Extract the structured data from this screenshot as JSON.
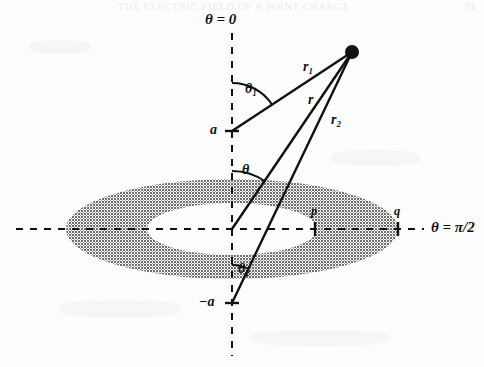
{
  "page": {
    "running_header": "THE ELECTRIC FIELD OF A POINT CHARGE",
    "page_number": "91",
    "background_color": "#fdfdfd",
    "ink_color": "#111111",
    "ring_fill_color": "#808080"
  },
  "figure": {
    "axes": {
      "vertical": {
        "label": "θ = 0",
        "style": "dashed",
        "x": 232,
        "y_top": 33,
        "y_bottom": 356
      },
      "horizontal": {
        "label": "θ = π/2",
        "style": "dashed",
        "y": 229,
        "x_left": 16,
        "x_right": 424
      }
    },
    "field_point": {
      "name": "field-point",
      "x": 352,
      "y": 52,
      "radius": 7
    },
    "origin": {
      "x": 232,
      "y": 229
    },
    "ticks": [
      {
        "id": "a",
        "label": "a",
        "axis": "vertical",
        "x": 232,
        "y": 131,
        "label_x": 210,
        "label_y": 123
      },
      {
        "id": "-a",
        "label": "−a",
        "axis": "vertical",
        "x": 232,
        "y": 303,
        "label_x": 199,
        "label_y": 295
      },
      {
        "id": "p",
        "label": "p",
        "axis": "horizontal",
        "x": 315,
        "y": 229,
        "label_x": 311,
        "label_y": 205
      },
      {
        "id": "q",
        "label": "q",
        "axis": "horizontal",
        "x": 398,
        "y": 229,
        "label_x": 394,
        "label_y": 205
      }
    ],
    "rays": [
      {
        "id": "r1",
        "label": "r₁",
        "from_x": 232,
        "from_y": 131,
        "to_x": 352,
        "to_y": 52,
        "label_x": 303,
        "label_y": 60
      },
      {
        "id": "r",
        "label": "r",
        "from_x": 232,
        "from_y": 229,
        "to_x": 352,
        "to_y": 52,
        "label_x": 308,
        "label_y": 93
      },
      {
        "id": "r2",
        "label": "r₂",
        "from_x": 232,
        "from_y": 303,
        "to_x": 352,
        "to_y": 52,
        "label_x": 331,
        "label_y": 113
      }
    ],
    "angles": [
      {
        "id": "theta1",
        "label": "θ₁",
        "vertex_x": 232,
        "vertex_y": 131,
        "label_x": 245,
        "label_y": 82,
        "radius": 48
      },
      {
        "id": "theta",
        "label": "θ",
        "vertex_x": 232,
        "vertex_y": 229,
        "label_x": 242,
        "label_y": 163,
        "radius": 58
      },
      {
        "id": "theta2",
        "label": "θ₂",
        "vertex_x": 232,
        "vertex_y": 303,
        "label_x": 238,
        "label_y": 262,
        "radius": 38
      }
    ],
    "annulus": {
      "name": "charged-ring",
      "center_x": 232,
      "center_y": 229,
      "outer_rx": 166,
      "outer_ry": 50,
      "inner_rx": 85,
      "inner_ry": 26,
      "fill": "#808080",
      "description": "shaded elliptical annulus (ring viewed in perspective)"
    }
  }
}
